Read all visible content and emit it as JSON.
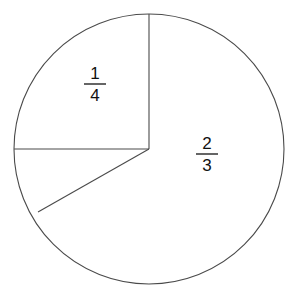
{
  "figure": {
    "background_color": "#ffffff",
    "line_color": "#4a4a4a",
    "text_color": "#111111"
  },
  "circle": {
    "center_x": 149,
    "center_y": 149,
    "radius": 135
  },
  "radii": [
    {
      "name": "radius-top",
      "from_x": 149,
      "from_y": 149,
      "to_x": 149,
      "to_y": 14,
      "angle_deg": 90
    },
    {
      "name": "radius-left",
      "from_x": 149,
      "from_y": 149,
      "to_x": 14,
      "to_y": 149,
      "angle_deg": 180
    },
    {
      "name": "radius-lower-left",
      "from_x": 149,
      "from_y": 149,
      "to_x": 38,
      "to_y": 212,
      "angle_deg": 209
    }
  ],
  "labels": [
    {
      "name": "fraction-label-one-quarter",
      "numerator": "1",
      "denominator": "4",
      "x": 95,
      "y": 82,
      "sector": "upper-left quadrant"
    },
    {
      "name": "fraction-label-two-thirds",
      "numerator": "2",
      "denominator": "3",
      "x": 207,
      "y": 152,
      "sector": "large right sector"
    }
  ]
}
